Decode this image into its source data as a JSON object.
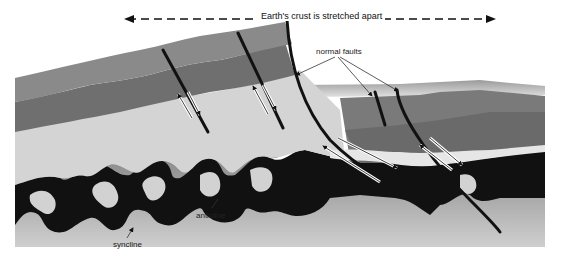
{
  "diagram": {
    "title": "Earth's crust is stretched apart",
    "labels": {
      "normal_faults": "normal faults",
      "anticline": "anticline",
      "syncline": "syncline"
    },
    "colors": {
      "background": "#ffffff",
      "top_layer": "#8a8a8a",
      "second_layer": "#707070",
      "light_layer": "#d4d4d4",
      "dark_layer": "#606060",
      "black_layer": "#111111",
      "basement_top": "#8c8c8c",
      "basement_bottom": "#c8c8c8",
      "fault_line": "#111111"
    },
    "arrows": {
      "stretch_direction": "bidirectional-horizontal"
    }
  }
}
